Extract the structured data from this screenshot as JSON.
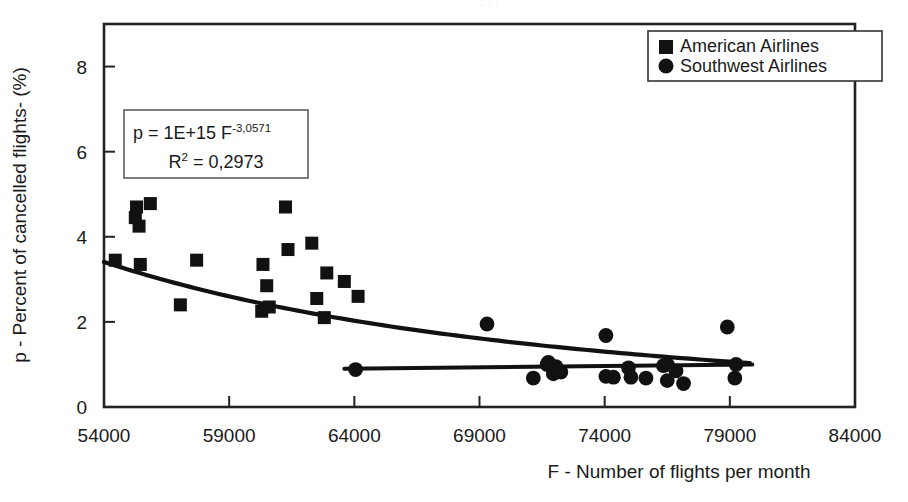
{
  "figure": {
    "top_artifact_text": "· · ·",
    "background": "#ffffff",
    "frame_color": "#222222",
    "marker_color": "#111111",
    "trend_color": "#111111"
  },
  "axes": {
    "x_title": "F - Number of flights per month",
    "y_title": "p - Percent of cancelled flights-  (%)",
    "x_ticks": [
      "54000",
      "59000",
      "64000",
      "69000",
      "74000",
      "79000",
      "84000"
    ],
    "y_ticks": [
      "0",
      "2",
      "4",
      "6",
      "8"
    ]
  },
  "legend": {
    "items": [
      {
        "label": "American Airlines",
        "marker": "square"
      },
      {
        "label": "Southwest Airlines",
        "marker": "circle"
      }
    ]
  },
  "annotation": {
    "equation_prefix": "p = 1E+15 F",
    "equation_exponent": "-3,0571",
    "r2_base": "R",
    "r2_sup": "2",
    "r2_value": " = 0,2973"
  },
  "chart_data": {
    "type": "scatter",
    "title": "",
    "xlabel": "F - Number of flights per month",
    "ylabel": "p - Percent of cancelled flights-  (%)",
    "xlim": [
      54000,
      84000
    ],
    "ylim": [
      0,
      9
    ],
    "xticks": [
      54000,
      59000,
      64000,
      69000,
      74000,
      79000,
      84000
    ],
    "yticks": [
      0,
      2,
      4,
      6,
      8
    ],
    "grid": false,
    "legend_position": "top-right",
    "series": [
      {
        "name": "American Airlines",
        "marker": "square",
        "color": "#111111",
        "points": [
          [
            54450,
            3.45
          ],
          [
            55300,
            4.7
          ],
          [
            55250,
            4.45
          ],
          [
            55400,
            4.25
          ],
          [
            55850,
            4.78
          ],
          [
            55450,
            3.35
          ],
          [
            57050,
            2.4
          ],
          [
            57700,
            3.45
          ],
          [
            60350,
            3.35
          ],
          [
            60500,
            2.85
          ],
          [
            60300,
            2.25
          ],
          [
            60600,
            2.35
          ],
          [
            61250,
            4.7
          ],
          [
            61350,
            3.7
          ],
          [
            62300,
            3.85
          ],
          [
            62900,
            3.15
          ],
          [
            62500,
            2.55
          ],
          [
            62800,
            2.1
          ],
          [
            63600,
            2.95
          ],
          [
            64150,
            2.6
          ]
        ]
      },
      {
        "name": "Southwest Airlines",
        "marker": "circle",
        "color": "#111111",
        "points": [
          [
            64050,
            0.88
          ],
          [
            69300,
            1.95
          ],
          [
            71150,
            0.68
          ],
          [
            71700,
            1.0
          ],
          [
            71750,
            1.05
          ],
          [
            72050,
            0.95
          ],
          [
            71950,
            0.78
          ],
          [
            72250,
            0.82
          ],
          [
            74050,
            1.68
          ],
          [
            74050,
            0.72
          ],
          [
            74350,
            0.7
          ],
          [
            74950,
            0.92
          ],
          [
            75050,
            0.7
          ],
          [
            75650,
            0.68
          ],
          [
            76350,
            0.97
          ],
          [
            76500,
            0.62
          ],
          [
            76500,
            1.0
          ],
          [
            76850,
            0.85
          ],
          [
            77150,
            0.55
          ],
          [
            78900,
            1.88
          ],
          [
            79250,
            1.0
          ],
          [
            79200,
            0.68
          ]
        ]
      }
    ],
    "trendlines": [
      {
        "name": "American Airlines power fit",
        "equation": "p = 1E+15 F^-3,0571",
        "r_squared": 0.2973,
        "model": "power",
        "coefficient": 1000000000000000.0,
        "exponent": -3.0571
      },
      {
        "name": "Southwest Airlines linear fit",
        "model": "linear",
        "y_at_x_min": 0.9,
        "y_at_x_max": 1.0
      }
    ]
  }
}
